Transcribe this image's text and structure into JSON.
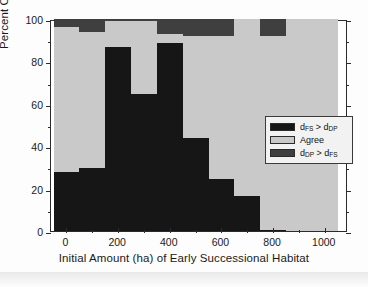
{
  "chart_data": {
    "type": "bar",
    "subtype": "stacked-bar",
    "title": "",
    "xlabel": "Initial Amount (ha) of Early Successional Habitat",
    "ylabel": "Percent Occurrence",
    "xlim": [
      -60,
      1090
    ],
    "ylim": [
      0,
      100
    ],
    "grid": false,
    "legend_position": "center-right-inside",
    "x_tick_labels": [
      "0",
      "200",
      "400",
      "600",
      "800",
      "1000"
    ],
    "x_tick_values": [
      0,
      200,
      400,
      600,
      800,
      1000
    ],
    "x_minor_tick_values": [
      100,
      300,
      500,
      700,
      900
    ],
    "y_tick_labels": [
      "0",
      "20",
      "40",
      "60",
      "80",
      "100"
    ],
    "y_tick_values": [
      0,
      20,
      40,
      60,
      80,
      100
    ],
    "y_minor_tick_values": [
      10,
      30,
      50,
      70,
      90
    ],
    "categories": [
      0,
      100,
      200,
      300,
      400,
      500,
      600,
      700,
      800,
      900,
      1000
    ],
    "bar_width": 100,
    "series": [
      {
        "name": "d_FS > d_DP",
        "legend_label": "dFS > dDP",
        "color": "#161616",
        "values": [
          28.0,
          29.5,
          87.0,
          64.5,
          88.5,
          44.0,
          24.5,
          16.5,
          0.5,
          0.0,
          0.0
        ]
      },
      {
        "name": "Agree",
        "legend_label": "Agree",
        "color": "#c9c9c9",
        "values": [
          68.0,
          64.5,
          12.0,
          34.5,
          4.5,
          48.0,
          67.5,
          83.5,
          91.5,
          100.0,
          100.0
        ]
      },
      {
        "name": "d_DP > d_FS",
        "legend_label": "dDP > dFS",
        "color": "#3f3f3f",
        "values": [
          4.0,
          6.0,
          1.0,
          1.0,
          7.0,
          8.0,
          8.0,
          0.0,
          8.0,
          0.0,
          0.0
        ]
      }
    ]
  },
  "axes": {
    "y_title": "Percent Occurrence",
    "x_title": "Initial Amount (ha) of Early Successional Habitat"
  },
  "legend": {
    "entries": [
      {
        "symbol": "d",
        "sub1": "FS",
        "relation": " > ",
        "symbol2": "d",
        "sub2": "DP",
        "plain": "dFS > dDP",
        "color": "#161616"
      },
      {
        "symbol": "Agree",
        "sub1": "",
        "relation": "",
        "symbol2": "",
        "sub2": "",
        "plain": "Agree",
        "color": "#c9c9c9"
      },
      {
        "symbol": "d",
        "sub1": "DP",
        "relation": " > ",
        "symbol2": "d",
        "sub2": "FS",
        "plain": "dDP > dFS",
        "color": "#3f3f3f"
      }
    ]
  },
  "colors": {
    "series_black": "#161616",
    "series_lightgray": "#c9c9c9",
    "series_darkgray": "#3f3f3f",
    "axis": "#2b2b2b",
    "background": "#ffffff",
    "legend_background": "#f2f2f2"
  }
}
